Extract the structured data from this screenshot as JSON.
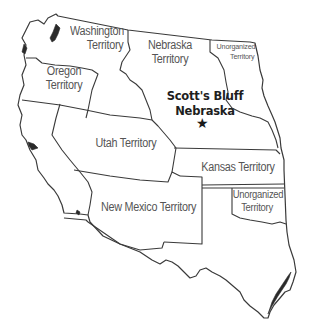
{
  "map": {
    "title_cut_off": "",
    "regions": [
      {
        "id": "washington",
        "lines": [
          "Washington",
          "Territory"
        ]
      },
      {
        "id": "oregon",
        "lines": [
          "Oregon",
          "Territory"
        ]
      },
      {
        "id": "nebraska",
        "lines": [
          "Nebraska",
          "Territory"
        ]
      },
      {
        "id": "unorganized_north",
        "lines": [
          "Unorganized",
          "Territory"
        ]
      },
      {
        "id": "utah",
        "lines": [
          "Utah Territory"
        ]
      },
      {
        "id": "kansas",
        "lines": [
          "Kansas Territory"
        ]
      },
      {
        "id": "new_mexico",
        "lines": [
          "New Mexico Territory"
        ]
      },
      {
        "id": "unorganized_south",
        "lines": [
          "Unorganized",
          "Territory"
        ]
      }
    ],
    "marker": {
      "lines": [
        "Scott's Bluff",
        "Nebraska"
      ],
      "icon": "star-icon",
      "glyph": "★"
    },
    "colors": {
      "border": "#3a3a3a",
      "label": "#555555",
      "marker_label": "#1e1e1e",
      "background": "#ffffff"
    }
  }
}
